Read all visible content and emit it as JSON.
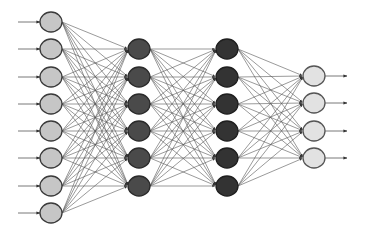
{
  "diagram": {
    "type": "feedforward-neural-network",
    "background": "#ffffff",
    "edge_color": "#555555",
    "edge_width": 0.6,
    "arrow_color": "#333333",
    "layers": [
      {
        "name": "input-layer",
        "x": 51,
        "node_count": 8,
        "ys": [
          22,
          49,
          77,
          104,
          131,
          158,
          186,
          213
        ],
        "fill": "#c6c6c6",
        "stroke": "#3a3a3a",
        "rx": 11,
        "ry": 10
      },
      {
        "name": "hidden-layer-1",
        "x": 139,
        "node_count": 6,
        "ys": [
          49,
          77,
          104,
          131,
          158,
          186
        ],
        "fill": "#4a4a4a",
        "stroke": "#2a2a2a",
        "rx": 11,
        "ry": 10
      },
      {
        "name": "hidden-layer-2",
        "x": 227,
        "node_count": 6,
        "ys": [
          49,
          77,
          104,
          131,
          158,
          186
        ],
        "fill": "#333333",
        "stroke": "#1e1e1e",
        "rx": 11,
        "ry": 10
      },
      {
        "name": "output-layer",
        "x": 314,
        "node_count": 4,
        "ys": [
          76,
          103,
          131,
          158
        ],
        "fill": "#e2e2e2",
        "stroke": "#555555",
        "rx": 11,
        "ry": 10
      }
    ],
    "input_arrows": {
      "x_start": 18,
      "x_end": 40
    },
    "output_arrows": {
      "x_start": 325,
      "x_end": 347
    }
  }
}
